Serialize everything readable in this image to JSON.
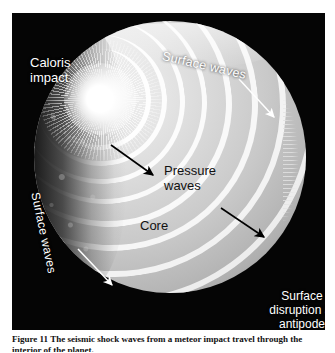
{
  "figure": {
    "panel_background": "#050505",
    "planet_tone": "#d2d2d2",
    "labels": {
      "caloris_impact": "Caloris\nimpact",
      "surface_waves_top": "Surface waves",
      "surface_waves_left": "Surface waves",
      "pressure_waves": "Pressure\nwaves",
      "core": "Core",
      "surface_disruption": "Surface\ndisruption at\nantipode"
    },
    "arrows": [
      {
        "name": "pressure-wave-arrow-upper",
        "color": "#000000",
        "direction": "down-right"
      },
      {
        "name": "pressure-wave-arrow-lower",
        "color": "#000000",
        "direction": "down-left"
      },
      {
        "name": "surface-wave-arrow-right",
        "color": "#ffffff",
        "direction": "down-right"
      },
      {
        "name": "surface-wave-arrow-left",
        "color": "#ffffff",
        "direction": "down-right"
      }
    ]
  },
  "caption": {
    "text": "Figure 11 The seismic shock waves from a meteor impact travel through the interior of the planet."
  }
}
